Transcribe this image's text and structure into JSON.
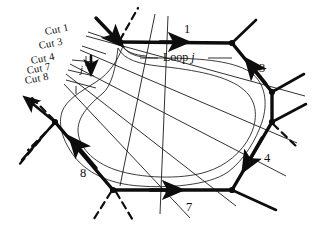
{
  "figure": {
    "type": "diagram",
    "background_color": "#ffffff",
    "ink_color": "#0d0d0d",
    "thin_color": "#1a1a1a"
  },
  "cut_labels": [
    {
      "id": "cut-1",
      "text": "Cut 1",
      "x": 46,
      "y": 27,
      "rotation": -11
    },
    {
      "id": "cut-3",
      "text": "Cut 3",
      "x": 40,
      "y": 41,
      "rotation": -11
    },
    {
      "id": "cut-4",
      "text": "Cut 4",
      "x": 32,
      "y": 56,
      "rotation": -11
    },
    {
      "id": "cut-7",
      "text": "Cut 7",
      "x": 28,
      "y": 66,
      "rotation": -11
    },
    {
      "id": "cut-8",
      "text": "Cut 8",
      "x": 26,
      "y": 76,
      "rotation": -11
    }
  ],
  "edge_labels": [
    {
      "id": "edge-1",
      "text": "1",
      "x": 184,
      "y": 23
    },
    {
      "id": "edge-3",
      "text": "3",
      "x": 259,
      "y": 62
    },
    {
      "id": "edge-4",
      "text": "4",
      "x": 264,
      "y": 152
    },
    {
      "id": "edge-7",
      "text": "7",
      "x": 186,
      "y": 201
    },
    {
      "id": "edge-8",
      "text": "8",
      "x": 80,
      "y": 167
    }
  ],
  "annotations": [
    {
      "id": "loop-j",
      "prefix": "Loop",
      "symbol": "j",
      "x": 163,
      "y": 58
    },
    {
      "id": "j-marker",
      "symbol": "j",
      "x": 80,
      "y": 68
    }
  ],
  "hexagon": {
    "vertices": [
      {
        "name": "top-left",
        "x": 120,
        "y": 42
      },
      {
        "name": "top-right",
        "x": 232,
        "y": 43
      },
      {
        "name": "right-upper",
        "x": 272,
        "y": 92
      },
      {
        "name": "right-lower",
        "x": 272,
        "y": 122
      },
      {
        "name": "bottom-right",
        "x": 232,
        "y": 190
      },
      {
        "name": "bottom-left",
        "x": 113,
        "y": 190
      }
    ]
  },
  "colors": {
    "ink": "#0d0d0d",
    "thin": "#1a1a1a",
    "paper": "#ffffff"
  }
}
